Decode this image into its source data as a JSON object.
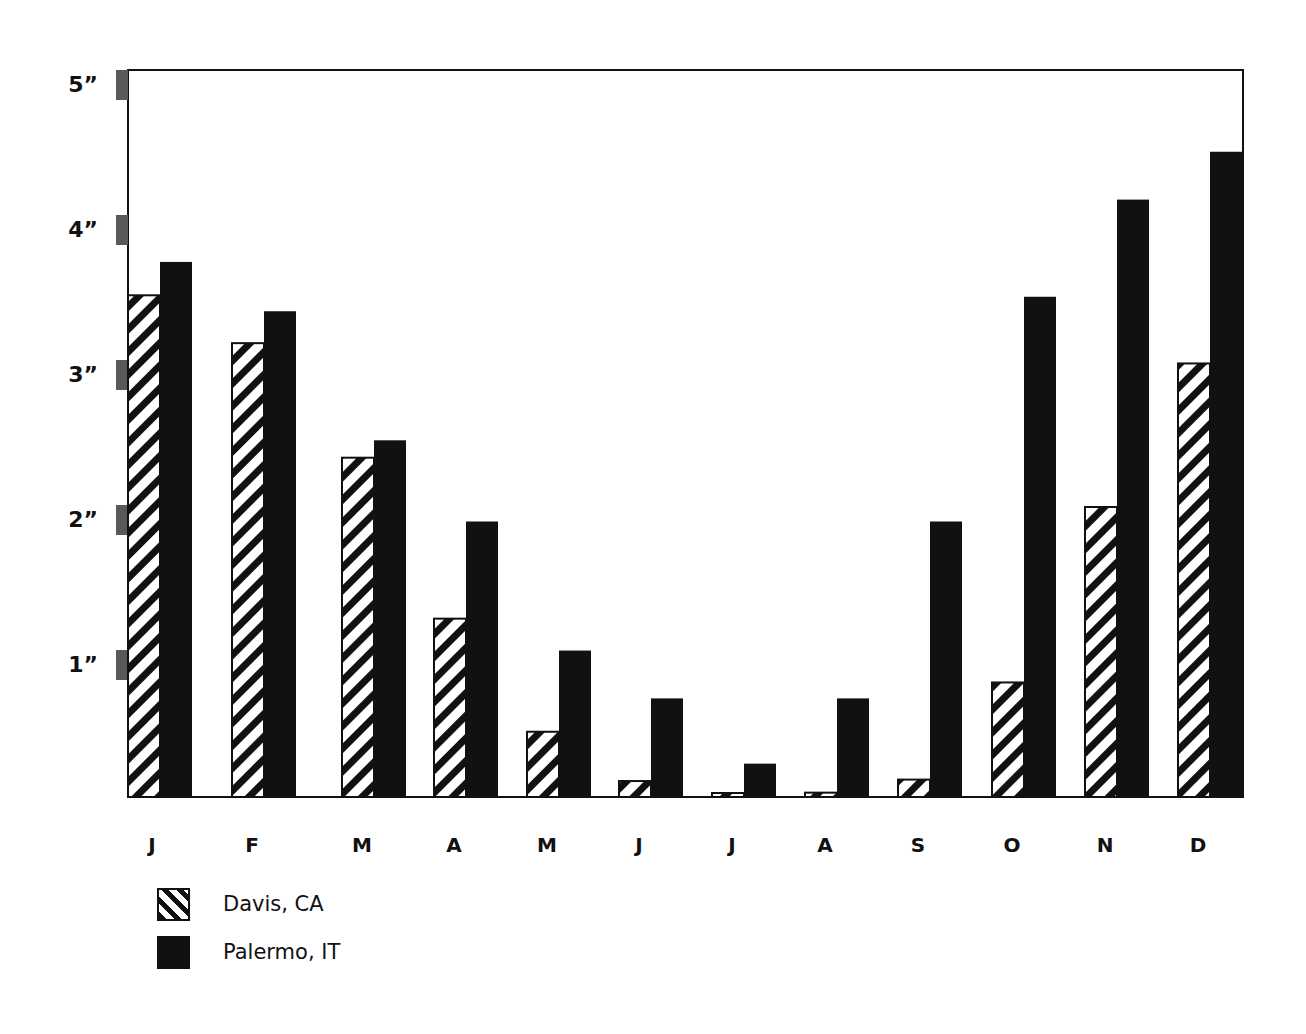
{
  "chart_data": {
    "type": "bar",
    "title": "",
    "xlabel": "",
    "ylabel": "",
    "categories": [
      "J",
      "F",
      "M",
      "A",
      "M",
      "J",
      "J",
      "A",
      "S",
      "O",
      "N",
      "D"
    ],
    "series": [
      {
        "name": "Davis, CA",
        "pattern": "diagonal-hatch",
        "color": "#111111",
        "values": [
          3.46,
          3.13,
          2.34,
          1.23,
          0.45,
          0.11,
          0.02,
          0.03,
          0.12,
          0.79,
          2.0,
          2.99
        ]
      },
      {
        "name": "Palermo, IT",
        "pattern": "solid",
        "color": "#111111",
        "values": [
          3.69,
          3.35,
          2.46,
          1.9,
          1.01,
          0.68,
          0.23,
          0.68,
          1.9,
          3.45,
          4.12,
          4.45
        ]
      }
    ],
    "ylim": [
      0,
      5
    ],
    "yticks": [
      1,
      2,
      3,
      4,
      5
    ],
    "ytick_labels": [
      "1”",
      "2”",
      "3”",
      "4”",
      "5”"
    ],
    "grid": false,
    "legend_position": "bottom-left"
  },
  "legend": {
    "items": [
      {
        "label": "Davis, CA"
      },
      {
        "label": "Palermo, IT"
      }
    ]
  },
  "colors": {
    "bar": "#111111",
    "tick_marker": "#5a5a5a",
    "background": "#ffffff"
  }
}
